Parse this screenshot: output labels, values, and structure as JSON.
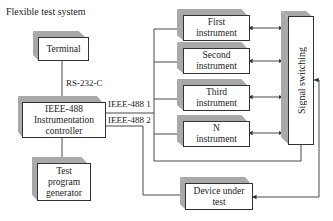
{
  "title": "Flexible test system",
  "blocks": {
    "terminal": {
      "lines": [
        "Terminal"
      ]
    },
    "controller": {
      "lines": [
        "IEEE-488",
        "Instrumentation",
        "controller"
      ]
    },
    "generator": {
      "lines": [
        "Test",
        "program",
        "generator"
      ]
    },
    "instruments": [
      {
        "lines": [
          "First",
          "instrument"
        ]
      },
      {
        "lines": [
          "Second",
          "instrument"
        ]
      },
      {
        "lines": [
          "Third",
          "instrument"
        ]
      },
      {
        "lines": [
          "N",
          "instrument"
        ]
      }
    ],
    "switching": {
      "label": "Signal switching"
    },
    "dut": {
      "lines": [
        "Device under",
        "test"
      ]
    }
  },
  "links": {
    "rs232": "RS-232-C",
    "ieee1": "IEEE-488 1",
    "ieee2": "IEEE-488 2"
  },
  "colors": {
    "line": "#333333",
    "bevel": "#a9a9a9",
    "face": "#ffffff"
  }
}
